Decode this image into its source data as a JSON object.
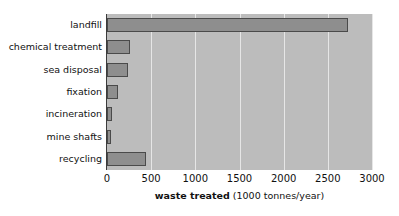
{
  "chart_data": {
    "type": "bar",
    "orientation": "horizontal",
    "title": "",
    "xlabel": "waste treated (1000 tonnes/year)",
    "xlabel_bold_part": "waste treated",
    "xlabel_unit_part": " (1000 tonnes/year)",
    "ylabel": "",
    "categories": [
      "landfill",
      "chemical treatment",
      "sea disposal",
      "fixation",
      "incineration",
      "mine shafts",
      "recycling"
    ],
    "values": [
      2730,
      255,
      235,
      125,
      55,
      45,
      440
    ],
    "xlim": [
      0,
      3000
    ],
    "xticks": [
      0,
      500,
      1000,
      1500,
      2000,
      2500,
      3000
    ],
    "xtick_labels": [
      "0",
      "500",
      "1000",
      "1500",
      "2000",
      "2500",
      "3000"
    ],
    "grid": true,
    "grid_axis": "x",
    "legend": false,
    "colors": {
      "bar_fill": "#8e8e8e",
      "bar_edge": "#4a4a4a",
      "plot_background": "#bcbcbc",
      "gridline": "#e6e6e6",
      "axis_line": "#3b3b3b",
      "text": "#111111",
      "figure_background": "#ffffff"
    }
  }
}
